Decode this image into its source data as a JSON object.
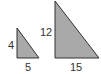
{
  "diagram": {
    "colors": {
      "fill": "#a9a9a9",
      "stroke": "#333333",
      "label": "#333333"
    },
    "triangles": [
      {
        "name": "small",
        "vertical_leg": "4",
        "horizontal_leg": "5",
        "points": "17,28 17,58 39,58"
      },
      {
        "name": "large",
        "vertical_leg": "12",
        "horizontal_leg": "15",
        "points": "55,1 55,58 99,58"
      }
    ]
  }
}
